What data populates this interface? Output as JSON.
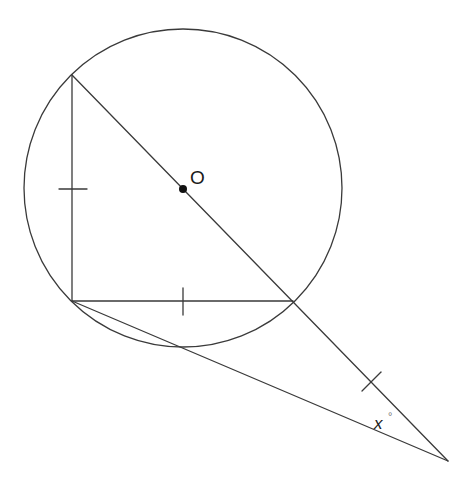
{
  "diagram": {
    "type": "geometry",
    "colors": {
      "background": "#ffffff",
      "stroke": "#3a3a3a",
      "text": "#1a1a1a"
    },
    "circle": {
      "cx": 183,
      "cy": 188,
      "r": 159
    },
    "center_point": {
      "x": 183,
      "y": 189,
      "r": 4,
      "label": "O",
      "label_x": 190,
      "label_y": 184
    },
    "points": {
      "A_top": {
        "x": 72,
        "y": 75
      },
      "B_right_angle": {
        "x": 72,
        "y": 301
      },
      "C_circle_right": {
        "x": 293,
        "y": 301
      },
      "D_circle_bottom": {
        "x": 185,
        "y": 349
      },
      "E_external": {
        "x": 448,
        "y": 461
      }
    },
    "segments": [
      {
        "name": "vertical-leg",
        "x1": 72,
        "y1": 75,
        "x2": 72,
        "y2": 301
      },
      {
        "name": "horizontal-leg",
        "x1": 72,
        "y1": 301,
        "x2": 293,
        "y2": 301
      },
      {
        "name": "diameter-extended-line",
        "x1": 72,
        "y1": 75,
        "x2": 448,
        "y2": 461
      },
      {
        "name": "secant-line",
        "x1": 72,
        "y1": 301,
        "x2": 448,
        "y2": 461
      }
    ],
    "tick_marks": [
      {
        "name": "tick-vertical-leg",
        "x1": 59,
        "y1": 189,
        "x2": 87,
        "y2": 189
      },
      {
        "name": "tick-horizontal-leg",
        "x1": 183,
        "y1": 288,
        "x2": 183,
        "y2": 315
      },
      {
        "name": "tick-extension",
        "x1": 362,
        "y1": 391,
        "x2": 381,
        "y2": 372
      }
    ],
    "angle_label": {
      "text": "x",
      "x": 374,
      "y": 429,
      "degree": "°",
      "deg_x": 388,
      "deg_y": 420
    }
  }
}
